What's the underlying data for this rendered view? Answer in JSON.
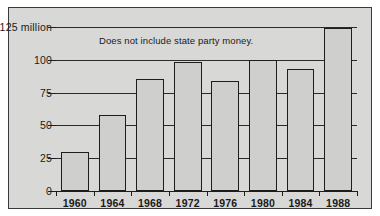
{
  "chart_data": {
    "type": "bar",
    "title": "",
    "subtitle": "",
    "xlabel": "",
    "ylabel": "",
    "categories": [
      "1960",
      "1964",
      "1968",
      "1972",
      "1976",
      "1980",
      "1984",
      "1988"
    ],
    "values": [
      30,
      58,
      85,
      98,
      84,
      100,
      93,
      124
    ],
    "ylim": [
      0,
      125
    ],
    "yticks": [
      0,
      25,
      50,
      75,
      100,
      125
    ],
    "ytick_labels": [
      "0",
      "25",
      "50",
      "75",
      "100",
      "$125 million"
    ],
    "grid": true,
    "legend": "none",
    "annotations": [
      "Does not include state party money."
    ],
    "units": "millions of dollars"
  },
  "annotation_text": "Does not include state party money.",
  "colors": {
    "bar_fill": "#cfcfcd",
    "bar_edge": "#1d1d1d",
    "plate_background": "#d8d8d6",
    "frame": "#3a3a3a",
    "gridline": "#2b2b2b",
    "text": "#1a1a1a",
    "page_background": "#ffffff"
  }
}
